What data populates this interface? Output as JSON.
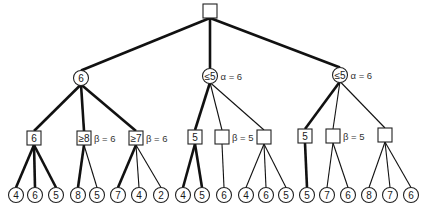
{
  "diagram": {
    "type": "game-tree-alpha-beta",
    "root": {
      "id": "root",
      "shape": "square",
      "label": "",
      "x": 210,
      "y": 11
    },
    "level1": [
      {
        "id": "n1",
        "shape": "circle",
        "label": "6",
        "x": 81,
        "y": 78,
        "annotation": ""
      },
      {
        "id": "n2",
        "shape": "circle",
        "label": "≤5",
        "x": 210,
        "y": 76,
        "annotation": "α = 6"
      },
      {
        "id": "n3",
        "shape": "circle",
        "label": "≤5",
        "x": 340,
        "y": 75,
        "annotation": "α = 6"
      }
    ],
    "level2": [
      {
        "id": "m1",
        "parent": "n1",
        "shape": "square",
        "label": "6",
        "x": 34,
        "y": 138,
        "annotation": "",
        "edge": "thick"
      },
      {
        "id": "m2",
        "parent": "n1",
        "shape": "square",
        "label": "≥8",
        "x": 84,
        "y": 138,
        "annotation": "β = 6",
        "edge": "thick"
      },
      {
        "id": "m3",
        "parent": "n1",
        "shape": "square",
        "label": "≥7",
        "x": 136,
        "y": 138,
        "annotation": "β = 6",
        "edge": "thick"
      },
      {
        "id": "m4",
        "parent": "n2",
        "shape": "square",
        "label": "5",
        "x": 195,
        "y": 137,
        "annotation": "",
        "edge": "thick"
      },
      {
        "id": "m5",
        "parent": "n2",
        "shape": "square",
        "label": "",
        "x": 222,
        "y": 137,
        "annotation": "β = 5",
        "edge": "thin"
      },
      {
        "id": "m6",
        "parent": "n2",
        "shape": "square",
        "label": "",
        "x": 264,
        "y": 137,
        "annotation": "",
        "edge": "thin"
      },
      {
        "id": "m7",
        "parent": "n3",
        "shape": "square",
        "label": "5",
        "x": 305,
        "y": 136,
        "annotation": "",
        "edge": "thick"
      },
      {
        "id": "m8",
        "parent": "n3",
        "shape": "square",
        "label": "",
        "x": 333,
        "y": 136,
        "annotation": "β = 5",
        "edge": "thin"
      },
      {
        "id": "m9",
        "parent": "n3",
        "shape": "square",
        "label": "",
        "x": 385,
        "y": 135,
        "annotation": "",
        "edge": "thin"
      }
    ],
    "leaves": [
      {
        "parent": "m1",
        "label": "4",
        "x": 16,
        "edge": "thick"
      },
      {
        "parent": "m1",
        "label": "6",
        "x": 35,
        "edge": "thick"
      },
      {
        "parent": "m1",
        "label": "5",
        "x": 56,
        "edge": "thick"
      },
      {
        "parent": "m2",
        "label": "8",
        "x": 78,
        "edge": "thick"
      },
      {
        "parent": "m2",
        "label": "5",
        "x": 97,
        "edge": "thin"
      },
      {
        "parent": "m3",
        "label": "7",
        "x": 118,
        "edge": "thick"
      },
      {
        "parent": "m3",
        "label": "4",
        "x": 139,
        "edge": "thin"
      },
      {
        "parent": "m3",
        "label": "2",
        "x": 161,
        "edge": "thin"
      },
      {
        "parent": "m4",
        "label": "4",
        "x": 183,
        "edge": "thick"
      },
      {
        "parent": "m4",
        "label": "5",
        "x": 202,
        "edge": "thick"
      },
      {
        "parent": "m5",
        "label": "6",
        "x": 224,
        "edge": "thin"
      },
      {
        "parent": "m6",
        "label": "4",
        "x": 246,
        "edge": "thin"
      },
      {
        "parent": "m6",
        "label": "6",
        "x": 266,
        "edge": "thin"
      },
      {
        "parent": "m6",
        "label": "5",
        "x": 286,
        "edge": "thin"
      },
      {
        "parent": "m7",
        "label": "5",
        "x": 307,
        "edge": "thick"
      },
      {
        "parent": "m8",
        "label": "7",
        "x": 327,
        "edge": "thin"
      },
      {
        "parent": "m8",
        "label": "6",
        "x": 348,
        "edge": "thin"
      },
      {
        "parent": "m9",
        "label": "8",
        "x": 369,
        "edge": "thin"
      },
      {
        "parent": "m9",
        "label": "7",
        "x": 390,
        "edge": "thin"
      },
      {
        "parent": "m9",
        "label": "6",
        "x": 411,
        "edge": "thin"
      }
    ],
    "leaf_y": 195,
    "root_edges": [
      "thick",
      "thick",
      "thick"
    ],
    "colors": {
      "stroke": "#111111",
      "fill": "#ffffff",
      "text": "#1a1a1a"
    }
  }
}
